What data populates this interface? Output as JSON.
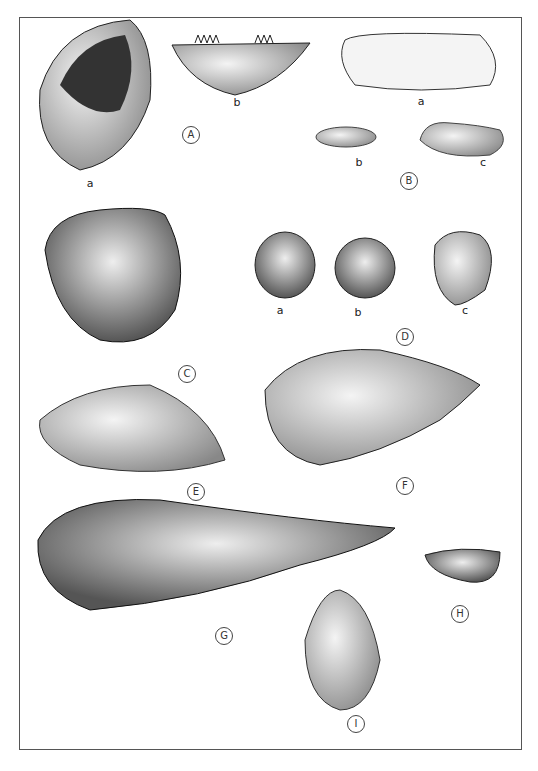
{
  "figure": {
    "specimens": [
      {
        "id": "A",
        "parts": [
          "a",
          "b"
        ]
      },
      {
        "id": "B",
        "parts": [
          "a",
          "b",
          "c"
        ]
      },
      {
        "id": "C",
        "parts": []
      },
      {
        "id": "D",
        "parts": [
          "a",
          "b",
          "c"
        ]
      },
      {
        "id": "E",
        "parts": []
      },
      {
        "id": "F",
        "parts": []
      },
      {
        "id": "G",
        "parts": []
      },
      {
        "id": "H",
        "parts": []
      },
      {
        "id": "I",
        "parts": []
      }
    ],
    "labels": {
      "A": "A",
      "B": "B",
      "C": "C",
      "D": "D",
      "E": "E",
      "F": "F",
      "G": "G",
      "H": "H",
      "I": "I",
      "Aa": "a",
      "Ab": "b",
      "Ba": "a",
      "Bb": "b",
      "Bc": "c",
      "Da": "a",
      "Db": "b",
      "Dc": "c"
    }
  }
}
